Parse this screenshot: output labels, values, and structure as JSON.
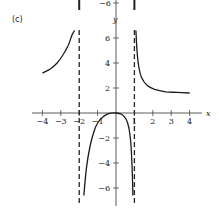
{
  "panel_label": "(c)",
  "chart_data": {
    "type": "line",
    "title": "",
    "xlabel": "x",
    "ylabel": "y",
    "xlim": [
      -4.3,
      4.6
    ],
    "ylim": [
      -6.5,
      6.5
    ],
    "grid": false,
    "x_ticks": [
      -4,
      -3,
      -2,
      -1,
      1,
      2,
      3,
      4
    ],
    "x_tick_labels": [
      "−4",
      "−3",
      "−2",
      "−1",
      "1",
      "2",
      "3",
      "4"
    ],
    "y_ticks": [
      6,
      4,
      2,
      -2,
      -4,
      -6
    ],
    "y_tick_labels": [
      "6",
      "4",
      "2",
      "−2",
      "−4",
      "−6"
    ],
    "top_fragment_label": "−6",
    "vertical_asymptotes": [
      -2,
      1
    ],
    "series": [
      {
        "name": "left branch",
        "points": [
          [
            -4.0,
            3.2
          ],
          [
            -3.6,
            3.5
          ],
          [
            -3.2,
            4.0
          ],
          [
            -2.9,
            4.6
          ],
          [
            -2.6,
            5.4
          ],
          [
            -2.4,
            6.2
          ],
          [
            -2.25,
            6.6
          ]
        ]
      },
      {
        "name": "middle branch",
        "points": [
          [
            -1.75,
            -6.6
          ],
          [
            -1.6,
            -4.3
          ],
          [
            -1.4,
            -2.6
          ],
          [
            -1.2,
            -1.5
          ],
          [
            -1.0,
            -0.8
          ],
          [
            -0.7,
            -0.3
          ],
          [
            -0.4,
            -0.05
          ],
          [
            0.0,
            0.0
          ],
          [
            0.3,
            -0.1
          ],
          [
            0.55,
            -0.5
          ],
          [
            0.7,
            -1.2
          ],
          [
            0.8,
            -2.3
          ],
          [
            0.86,
            -3.8
          ],
          [
            0.9,
            -5.5
          ],
          [
            0.92,
            -6.6
          ]
        ]
      },
      {
        "name": "right branch",
        "points": [
          [
            1.08,
            6.6
          ],
          [
            1.15,
            4.8
          ],
          [
            1.25,
            3.6
          ],
          [
            1.4,
            2.8
          ],
          [
            1.7,
            2.2
          ],
          [
            2.1,
            1.9
          ],
          [
            2.7,
            1.7
          ],
          [
            3.3,
            1.65
          ],
          [
            4.0,
            1.6
          ]
        ]
      }
    ]
  }
}
